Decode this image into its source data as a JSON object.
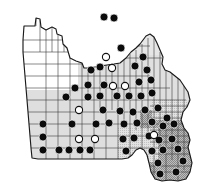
{
  "figure": {
    "name": "missouri-county-distribution-map",
    "title": "",
    "state": "Missouri",
    "width": 206,
    "height": 184,
    "background_color": "#ffffff"
  },
  "legend_symbols": [
    {
      "key": "filled",
      "label": "filled circle",
      "fill": "#0b0b0b",
      "stroke": "#ffffff"
    },
    {
      "key": "open",
      "label": "open circle",
      "fill": "#ffffff",
      "stroke": "#111111"
    }
  ],
  "shading": {
    "white": "#ffffff",
    "light_gray": "#dcdcdc",
    "medium_gray": "#c4c4c4",
    "dark_gray": "#9a9a9a",
    "county_border": "#3a3a3a",
    "state_border": "#1a1a1a"
  },
  "chart_data": {
    "type": "map",
    "title": "",
    "xlabel": "",
    "ylabel": "",
    "region": "Missouri counties",
    "marker_types": [
      "filled",
      "open"
    ],
    "counts": {
      "filled": 53,
      "open": 9,
      "total": 62
    },
    "markers": [
      {
        "x": 104,
        "y": 17,
        "type": "filled"
      },
      {
        "x": 114,
        "y": 18,
        "type": "filled"
      },
      {
        "x": 121,
        "y": 48,
        "type": "filled"
      },
      {
        "x": 100,
        "y": 67,
        "type": "filled"
      },
      {
        "x": 112,
        "y": 68,
        "type": "open"
      },
      {
        "x": 135,
        "y": 66,
        "type": "filled"
      },
      {
        "x": 75,
        "y": 88,
        "type": "filled"
      },
      {
        "x": 88,
        "y": 85,
        "type": "filled"
      },
      {
        "x": 104,
        "y": 85,
        "type": "filled"
      },
      {
        "x": 113,
        "y": 86,
        "type": "open"
      },
      {
        "x": 125,
        "y": 86,
        "type": "open"
      },
      {
        "x": 139,
        "y": 82,
        "type": "filled"
      },
      {
        "x": 151,
        "y": 80,
        "type": "filled"
      },
      {
        "x": 88,
        "y": 97,
        "type": "filled"
      },
      {
        "x": 100,
        "y": 96,
        "type": "filled"
      },
      {
        "x": 117,
        "y": 96,
        "type": "filled"
      },
      {
        "x": 129,
        "y": 96,
        "type": "filled"
      },
      {
        "x": 141,
        "y": 96,
        "type": "filled"
      },
      {
        "x": 152,
        "y": 93,
        "type": "filled"
      },
      {
        "x": 79,
        "y": 110,
        "type": "open"
      },
      {
        "x": 103,
        "y": 110,
        "type": "filled"
      },
      {
        "x": 120,
        "y": 111,
        "type": "filled"
      },
      {
        "x": 133,
        "y": 112,
        "type": "filled"
      },
      {
        "x": 145,
        "y": 110,
        "type": "filled"
      },
      {
        "x": 158,
        "y": 108,
        "type": "filled"
      },
      {
        "x": 167,
        "y": 118,
        "type": "filled"
      },
      {
        "x": 43,
        "y": 124,
        "type": "filled"
      },
      {
        "x": 72,
        "y": 124,
        "type": "filled"
      },
      {
        "x": 96,
        "y": 124,
        "type": "filled"
      },
      {
        "x": 109,
        "y": 123,
        "type": "filled"
      },
      {
        "x": 124,
        "y": 124,
        "type": "filled"
      },
      {
        "x": 137,
        "y": 123,
        "type": "filled"
      },
      {
        "x": 152,
        "y": 122,
        "type": "filled"
      },
      {
        "x": 163,
        "y": 126,
        "type": "filled"
      },
      {
        "x": 174,
        "y": 124,
        "type": "filled"
      },
      {
        "x": 43,
        "y": 137,
        "type": "filled"
      },
      {
        "x": 79,
        "y": 139,
        "type": "open"
      },
      {
        "x": 95,
        "y": 139,
        "type": "open"
      },
      {
        "x": 123,
        "y": 139,
        "type": "filled"
      },
      {
        "x": 134,
        "y": 138,
        "type": "filled"
      },
      {
        "x": 149,
        "y": 136,
        "type": "filled"
      },
      {
        "x": 159,
        "y": 140,
        "type": "filled"
      },
      {
        "x": 172,
        "y": 139,
        "type": "filled"
      },
      {
        "x": 43,
        "y": 150,
        "type": "filled"
      },
      {
        "x": 59,
        "y": 150,
        "type": "filled"
      },
      {
        "x": 69,
        "y": 150,
        "type": "filled"
      },
      {
        "x": 80,
        "y": 150,
        "type": "filled"
      },
      {
        "x": 90,
        "y": 150,
        "type": "filled"
      },
      {
        "x": 126,
        "y": 151,
        "type": "filled"
      },
      {
        "x": 152,
        "y": 151,
        "type": "filled"
      },
      {
        "x": 163,
        "y": 150,
        "type": "filled"
      },
      {
        "x": 178,
        "y": 149,
        "type": "filled"
      },
      {
        "x": 158,
        "y": 163,
        "type": "filled"
      },
      {
        "x": 183,
        "y": 161,
        "type": "filled"
      },
      {
        "x": 160,
        "y": 174,
        "type": "filled"
      },
      {
        "x": 176,
        "y": 172,
        "type": "filled"
      },
      {
        "x": 91,
        "y": 70,
        "type": "filled"
      },
      {
        "x": 143,
        "y": 57,
        "type": "filled"
      },
      {
        "x": 106,
        "y": 57,
        "type": "open"
      },
      {
        "x": 66,
        "y": 97,
        "type": "filled"
      },
      {
        "x": 147,
        "y": 70,
        "type": "filled"
      },
      {
        "x": 154,
        "y": 135,
        "type": "open"
      }
    ]
  }
}
